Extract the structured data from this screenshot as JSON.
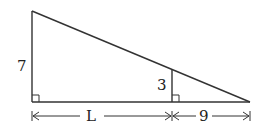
{
  "diagram": {
    "type": "similar-right-triangles",
    "labels": {
      "large_height": "7",
      "small_height": "3",
      "base_left": "L",
      "base_right": "9"
    },
    "right_angle_markers": [
      "bottom-left",
      "inner-foot"
    ],
    "stroke_color": "#333333"
  }
}
